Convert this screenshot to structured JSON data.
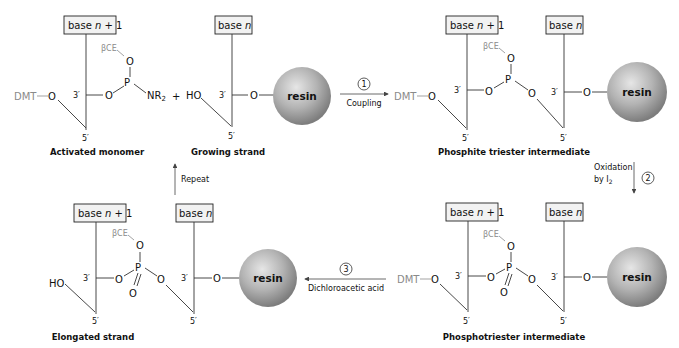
{
  "colors": {
    "resin_light": "#d9d9d9",
    "resin_dark": "#8c8c8c",
    "box_fill": "#f2f2f2",
    "protecting_group_gray": "#8a8a8a",
    "line": "#333333"
  },
  "labels": {
    "base_n1_prefix": "base ",
    "base_n_prefix": "base ",
    "n": "n",
    "plus_one": " + 1",
    "beta_ce": "βCE",
    "o": "O",
    "p": "P",
    "nr2": "NR",
    "sub2": "2",
    "ho": "HO",
    "dmt": "DMT",
    "three_prime": "3′",
    "five_prime": "5′",
    "plus": "+",
    "resin": "resin"
  },
  "structures": {
    "activated_monomer": {
      "caption": "Activated monomer"
    },
    "growing_strand": {
      "caption": "Growing strand"
    },
    "phosphite_triester": {
      "caption": "Phosphite triester intermediate"
    },
    "phosphotriester": {
      "caption": "Phosphotriester intermediate"
    },
    "elongated_strand": {
      "caption": "Elongated strand"
    }
  },
  "steps": [
    {
      "number": "1",
      "label": "Coupling",
      "direction": "right"
    },
    {
      "number": "2",
      "label_line1": "Oxidation",
      "label_line2": "by I",
      "label_sub": "2",
      "direction": "down"
    },
    {
      "number": "3",
      "label": "Dichloroacetic acid",
      "direction": "left"
    },
    {
      "label": "Repeat",
      "direction": "up"
    }
  ]
}
